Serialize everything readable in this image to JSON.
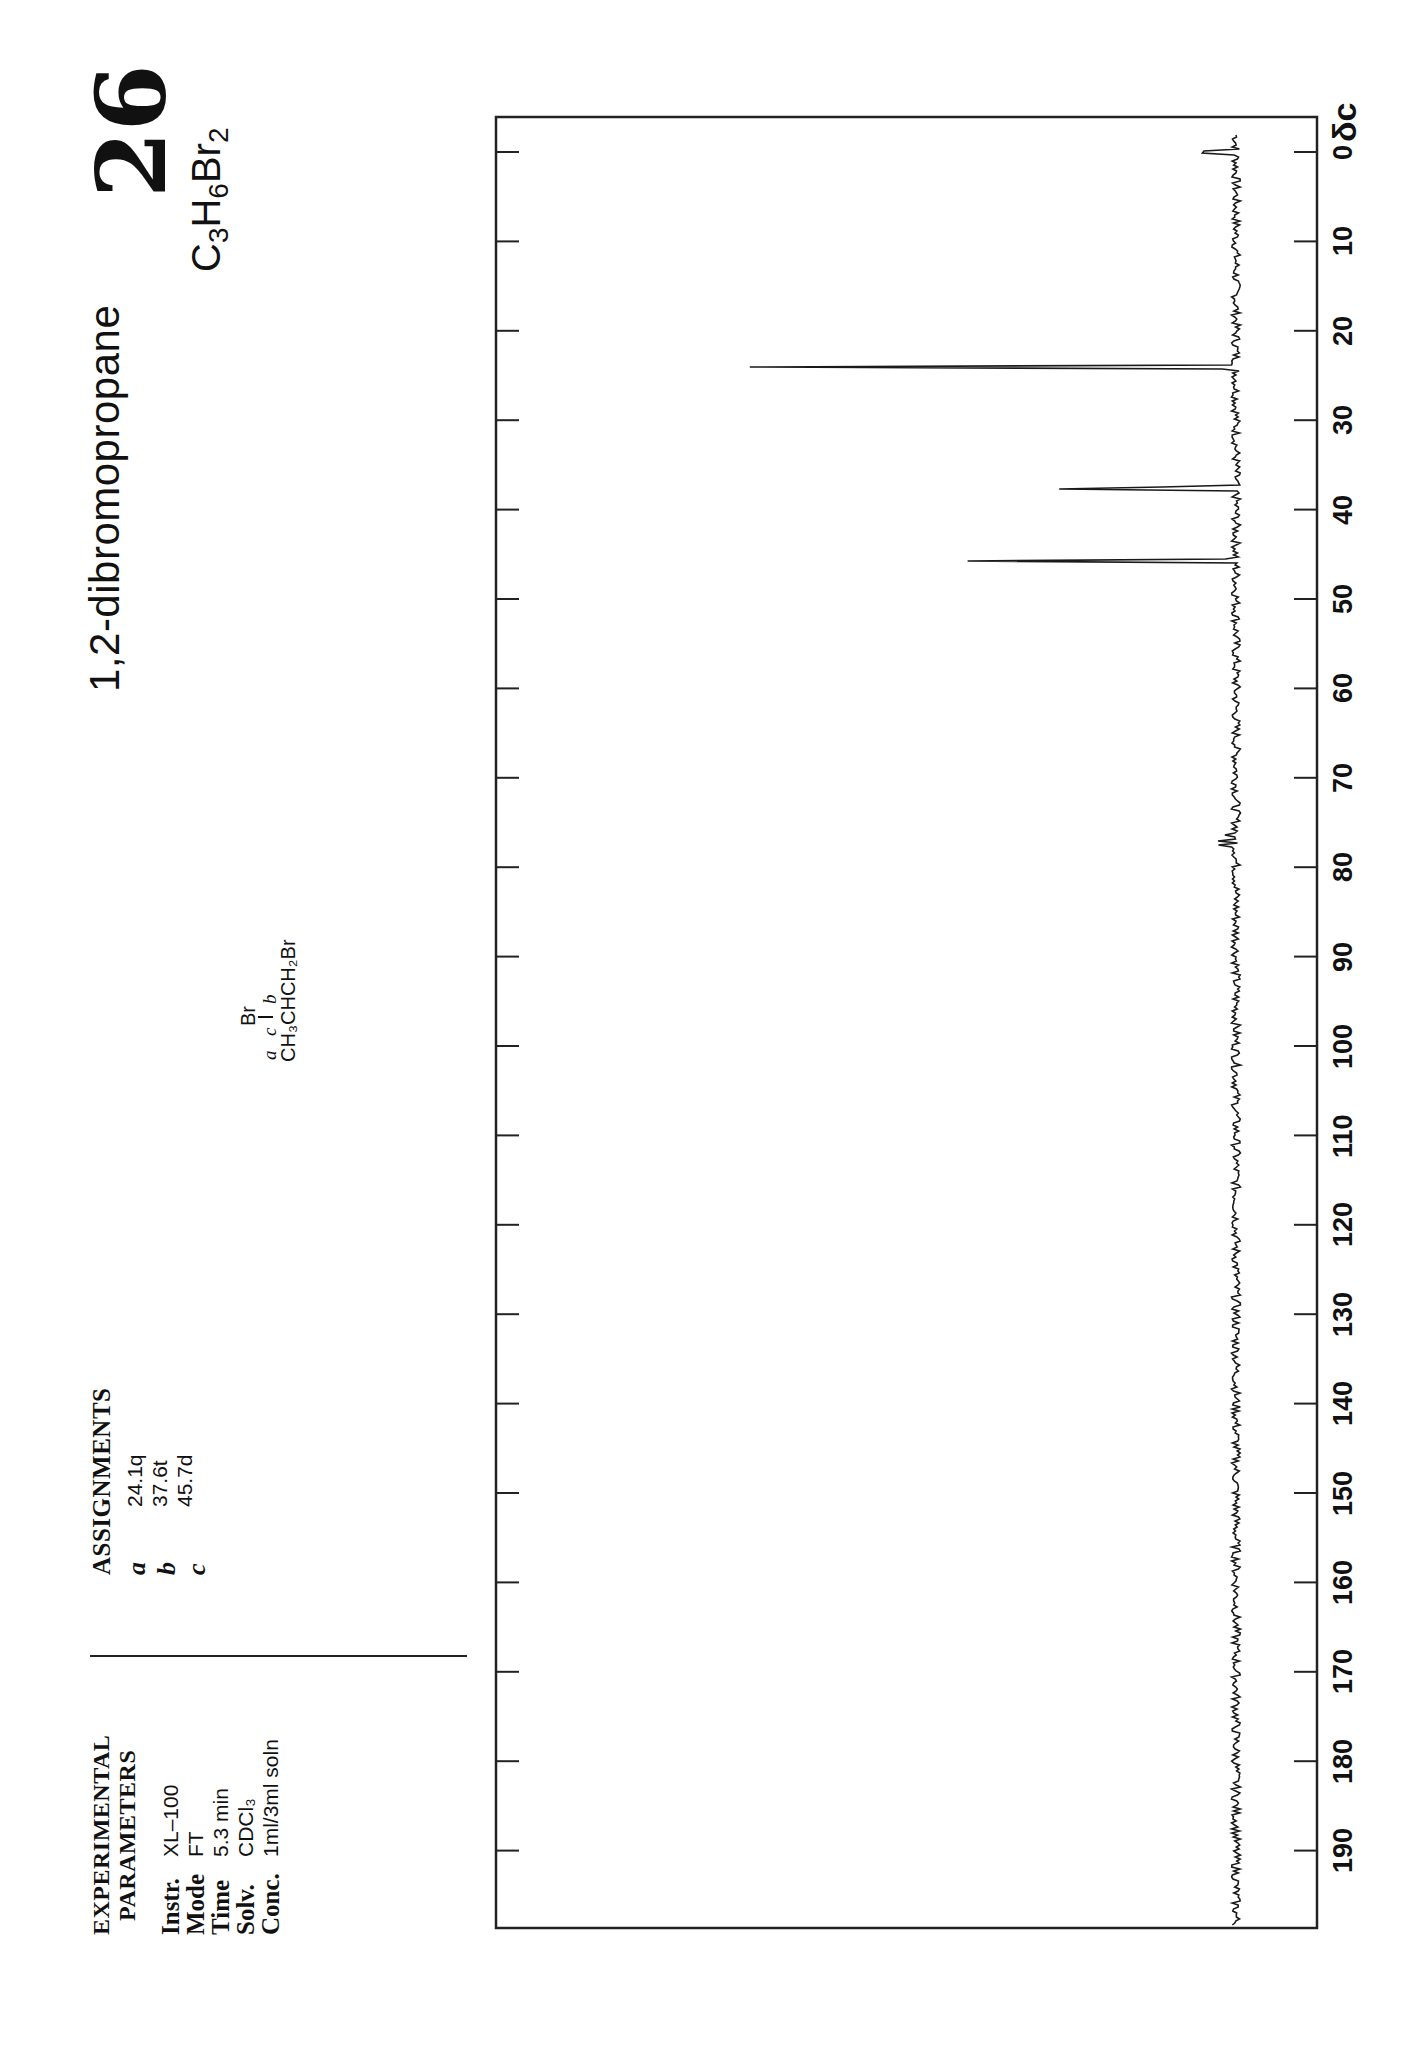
{
  "page": {
    "number": "26",
    "compound_name": "1,2-dibromopropane",
    "formula": {
      "parts": [
        {
          "el": "C",
          "n": "3"
        },
        {
          "el": "H",
          "n": "6"
        },
        {
          "el": "Br",
          "n": "2"
        }
      ]
    }
  },
  "experimental": {
    "heading_line1": "EXPERIMENTAL",
    "heading_line2": "PARAMETERS",
    "rows": [
      {
        "key": "Instr.",
        "value": "XL–100"
      },
      {
        "key": "Mode",
        "value": "FT"
      },
      {
        "key": "Time",
        "value": "5.3 min"
      },
      {
        "key": "Solv.",
        "value": "CDCl₃"
      },
      {
        "key": "Conc.",
        "value": "1ml/3ml soln"
      }
    ]
  },
  "assignments": {
    "heading": "ASSIGNMENTS",
    "rows": [
      {
        "key": "a",
        "value": "24.1q"
      },
      {
        "key": "b",
        "value": "37.6t"
      },
      {
        "key": "c",
        "value": "45.7d"
      }
    ]
  },
  "structure": {
    "top": "Br",
    "labels": {
      "a": "a",
      "c": "c",
      "b": "b"
    },
    "formula": "CH₃CHCH₂Br"
  },
  "axis": {
    "unit_label": "δc",
    "ticks": [
      "0",
      "10",
      "20",
      "30",
      "40",
      "50",
      "60",
      "70",
      "80",
      "90",
      "100",
      "110",
      "120",
      "130",
      "140",
      "150",
      "160",
      "170",
      "180",
      "190"
    ]
  },
  "chart_data": {
    "type": "line",
    "xlabel": "δc (ppm)",
    "ylabel": "intensity",
    "xlim": [
      0,
      200
    ],
    "x_ticks": [
      0,
      10,
      20,
      30,
      40,
      50,
      60,
      70,
      80,
      90,
      100,
      110,
      120,
      130,
      140,
      150,
      160,
      170,
      180,
      190
    ],
    "grid": false,
    "orientation": "rotated 90° (ppm axis vertical, increasing downward)",
    "peaks": [
      {
        "label": "TMS",
        "ppm": 0.0,
        "relative_height": 0.23
      },
      {
        "label": "a",
        "ppm": 24.1,
        "multiplicity": "q",
        "relative_height": 1.0
      },
      {
        "label": "b",
        "ppm": 37.6,
        "multiplicity": "t",
        "relative_height": 0.84
      },
      {
        "label": "c",
        "ppm": 45.7,
        "multiplicity": "d",
        "relative_height": 0.55
      },
      {
        "label": "CDCl3",
        "ppm": 76.5,
        "relative_height": 0.05
      },
      {
        "label": "CDCl3",
        "ppm": 77.0,
        "relative_height": 0.04
      },
      {
        "label": "CDCl3",
        "ppm": 77.5,
        "relative_height": 0.03
      }
    ]
  }
}
